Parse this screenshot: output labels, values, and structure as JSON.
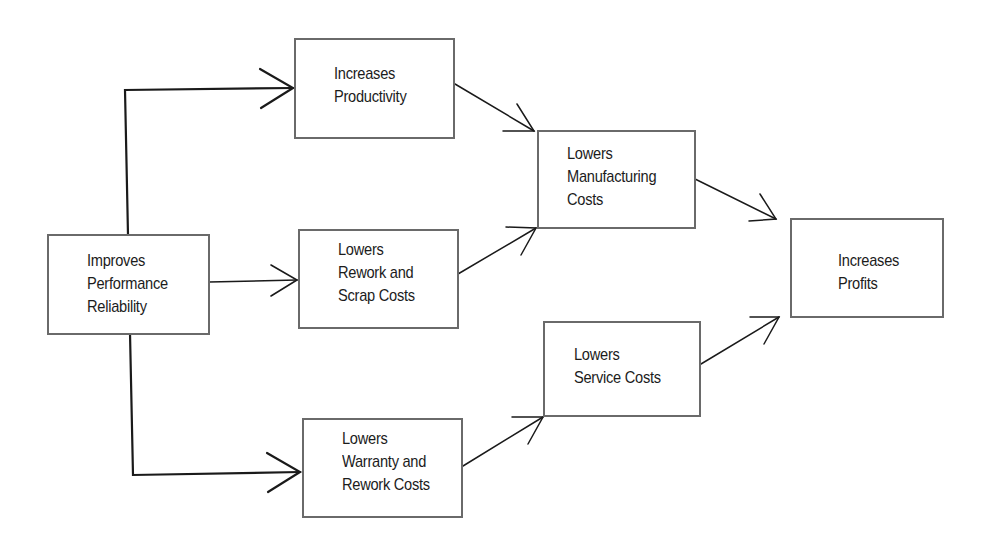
{
  "diagram": {
    "type": "flowchart",
    "nodes": [
      {
        "id": "improves-performance-reliability",
        "lines": [
          "Improves",
          "Performance",
          "Reliability"
        ]
      },
      {
        "id": "increases-productivity",
        "lines": [
          "Increases",
          "Productivity"
        ]
      },
      {
        "id": "lowers-rework-scrap-costs",
        "lines": [
          "Lowers",
          "Rework and",
          "Scrap Costs"
        ]
      },
      {
        "id": "lowers-warranty-rework-costs",
        "lines": [
          "Lowers",
          "Warranty and",
          "Rework Costs"
        ]
      },
      {
        "id": "lowers-manufacturing-costs",
        "lines": [
          "Lowers",
          "Manufacturing",
          "Costs"
        ]
      },
      {
        "id": "lowers-service-costs",
        "lines": [
          "Lowers",
          "Service Costs"
        ]
      },
      {
        "id": "increases-profits",
        "lines": [
          "Increases",
          "Profits"
        ]
      }
    ],
    "edges": [
      {
        "from": "improves-performance-reliability",
        "to": "increases-productivity",
        "style": "elbow"
      },
      {
        "from": "improves-performance-reliability",
        "to": "lowers-rework-scrap-costs",
        "style": "straight"
      },
      {
        "from": "improves-performance-reliability",
        "to": "lowers-warranty-rework-costs",
        "style": "elbow"
      },
      {
        "from": "increases-productivity",
        "to": "lowers-manufacturing-costs",
        "style": "diagonal"
      },
      {
        "from": "lowers-rework-scrap-costs",
        "to": "lowers-manufacturing-costs",
        "style": "diagonal"
      },
      {
        "from": "lowers-warranty-rework-costs",
        "to": "lowers-service-costs",
        "style": "diagonal"
      },
      {
        "from": "lowers-manufacturing-costs",
        "to": "increases-profits",
        "style": "diagonal"
      },
      {
        "from": "lowers-service-costs",
        "to": "increases-profits",
        "style": "diagonal"
      }
    ],
    "colors": {
      "box_border": "#6a6a6a",
      "line": "#1a1a1a",
      "text": "#1c1c1c",
      "background": "#ffffff"
    }
  }
}
